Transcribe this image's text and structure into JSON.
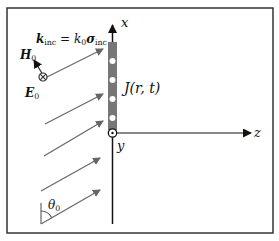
{
  "diagram": {
    "axes": {
      "x_label": "x",
      "y_label": "y",
      "z_label": "z"
    },
    "wave_vector": {
      "lhs": "k",
      "lhs_sub": "inc",
      "eq": " = k",
      "k_sub": "0",
      "sigma": "σ",
      "sigma_sub": "inc"
    },
    "fields": {
      "H_label": "H",
      "H_sub": "0",
      "E_label": "E",
      "E_sub": "0"
    },
    "current_label": "J(r, t)",
    "angle": {
      "symbol": "θ",
      "sub": "0"
    },
    "colors": {
      "frame": "#333333",
      "arrow": "#666666",
      "sheet": "#777777",
      "axis": "#111111",
      "dot": "#ffffff"
    },
    "incident_rays": 5,
    "sheet_dots": 4
  }
}
